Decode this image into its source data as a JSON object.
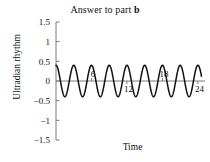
{
  "chart_data": {
    "type": "line",
    "title": "Answer to part b",
    "title_plain": "Answer to part ",
    "title_bold": "b",
    "xlabel": "Time",
    "ylabel": "Ultradian rhythm",
    "xlim": [
      0,
      25.2
    ],
    "ylim": [
      -1.5,
      1.5
    ],
    "grid": false,
    "legend": null,
    "yticks": [
      1.5,
      1,
      0.5,
      0,
      -0.5,
      -1,
      -1.5
    ],
    "ytick_labels": [
      "1.5",
      "1",
      "0.5",
      "0",
      "−0.5",
      "−1",
      "−1.5"
    ],
    "xticks": [
      6,
      12,
      18,
      24
    ],
    "xtick_labels": [
      "6",
      "12",
      "18",
      "24"
    ],
    "xtick_label_positions": [
      "above",
      "below",
      "above",
      "below"
    ],
    "series": [
      {
        "name": "Ultradian rhythm",
        "function": "y = 0.4 cos(2πx/3)",
        "amplitude": 0.4,
        "period": 3,
        "cycles": 8,
        "phase": "cosine",
        "color": "#111111",
        "x": [
          0,
          0.75,
          1.5,
          2.25,
          3,
          3.75,
          4.5,
          5.25,
          6,
          6.75,
          7.5,
          8.25,
          9,
          9.75,
          10.5,
          11.25,
          12,
          12.75,
          13.5,
          14.25,
          15,
          15.75,
          16.5,
          17.25,
          18,
          18.75,
          19.5,
          20.25,
          21,
          21.75,
          22.5,
          23.25,
          24
        ],
        "values": [
          0.4,
          0,
          -0.4,
          0,
          0.4,
          0,
          -0.4,
          0,
          0.4,
          0,
          -0.4,
          0,
          0.4,
          0,
          -0.4,
          0,
          0.4,
          0,
          -0.4,
          0,
          0.4,
          0,
          -0.4,
          0,
          0.4,
          0,
          -0.4,
          0,
          0.4,
          0,
          -0.4,
          0,
          0.4
        ]
      }
    ]
  },
  "figure": {
    "axis_color": "#7a7a7a",
    "curve_color": "#111111",
    "background": "#ffffff"
  }
}
